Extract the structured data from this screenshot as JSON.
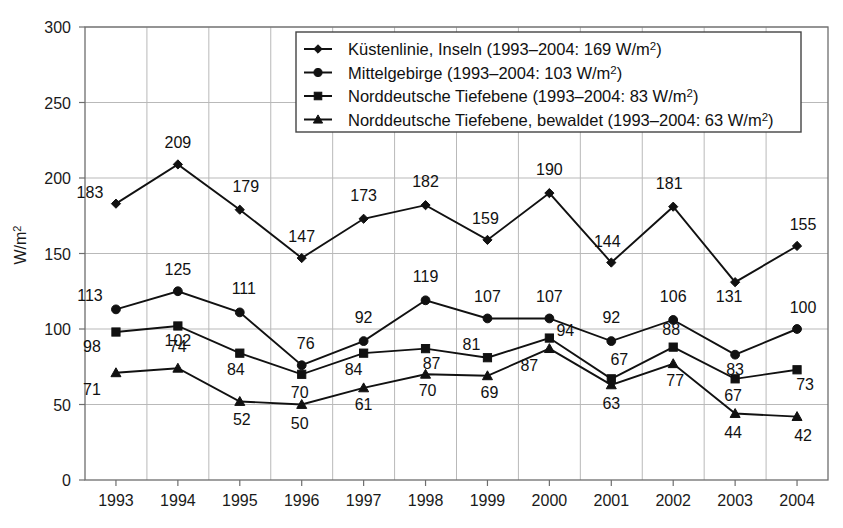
{
  "chart_data": {
    "type": "line",
    "title": "",
    "xlabel": "",
    "ylabel": "W/m²",
    "categories": [
      "1993",
      "1994",
      "1995",
      "1996",
      "1997",
      "1998",
      "1999",
      "2000",
      "2001",
      "2002",
      "2003",
      "2004"
    ],
    "ylim": [
      0,
      300
    ],
    "ytick_labels": [
      "0",
      "50",
      "100",
      "150",
      "200",
      "250",
      "300"
    ],
    "ytick_values": [
      0,
      50,
      100,
      150,
      200,
      250,
      300
    ],
    "grid": true,
    "legend_position": "top-center",
    "series": [
      {
        "name": "Küstenlinie, Inseln",
        "legend_label": "Küstenlinie, Inseln (1993–2004: 169 W/m²)",
        "mean_label": "169",
        "marker": "diamond",
        "values": [
          183,
          209,
          179,
          147,
          173,
          182,
          159,
          190,
          144,
          181,
          131,
          155
        ],
        "point_labels": [
          "183",
          "209",
          "179",
          "147",
          "173",
          "182",
          "159",
          "190",
          "144",
          "181",
          "131",
          "155"
        ]
      },
      {
        "name": "Mittelgebirge",
        "legend_label": "Mittelgebirge (1993–2004: 103 W/m²)",
        "mean_label": "103",
        "marker": "circle",
        "values": [
          113,
          125,
          111,
          76,
          92,
          119,
          107,
          107,
          92,
          106,
          83,
          100
        ],
        "point_labels": [
          "113",
          "125",
          "111",
          "76",
          "92",
          "119",
          "107",
          "107",
          "92",
          "106",
          "83",
          "100"
        ]
      },
      {
        "name": "Norddeutsche Tiefebene",
        "legend_label": "Norddeutsche Tiefebene (1993–2004: 83 W/m²)",
        "mean_label": "83",
        "marker": "square",
        "values": [
          98,
          102,
          84,
          70,
          84,
          87,
          81,
          94,
          67,
          88,
          67,
          73
        ],
        "point_labels": [
          "98",
          "102",
          "84",
          "70",
          "84",
          "87",
          "81",
          "94",
          "67",
          "88",
          "67",
          "73"
        ]
      },
      {
        "name": "Norddeutsche Tiefebene, bewaldet",
        "legend_label": "Norddeutsche Tiefebene, bewaldet (1993–2004: 63 W/m²)",
        "mean_label": "63",
        "marker": "triangle",
        "values": [
          71,
          74,
          52,
          50,
          61,
          70,
          69,
          87,
          63,
          77,
          44,
          42
        ],
        "point_labels": [
          "71",
          "74",
          "52",
          "50",
          "61",
          "70",
          "69",
          "87",
          "63",
          "77",
          "44",
          "42"
        ]
      }
    ],
    "colors": {
      "line": "#111111",
      "grid": "#b9b9b9",
      "frame": "#6e6e6e",
      "text": "#1a1a1a",
      "background": "#ffffff"
    }
  }
}
